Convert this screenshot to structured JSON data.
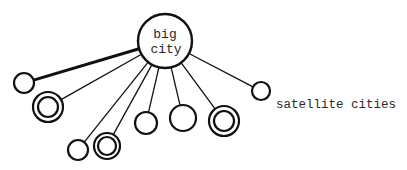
{
  "diagram": {
    "hub": {
      "label_line1": "big",
      "label_line2": "city",
      "cx": 165,
      "cy": 41,
      "r": 27
    },
    "satellites": [
      {
        "id": "sat-1",
        "cx": 24,
        "cy": 83,
        "r": 10,
        "double": false,
        "thick_link": true
      },
      {
        "id": "sat-2",
        "cx": 48,
        "cy": 107,
        "r": 15,
        "inner_r": 10,
        "double": true,
        "thick_link": false
      },
      {
        "id": "sat-3",
        "cx": 78,
        "cy": 150,
        "r": 10,
        "double": false,
        "thick_link": false
      },
      {
        "id": "sat-4",
        "cx": 107,
        "cy": 146,
        "r": 13,
        "inner_r": 9,
        "double": true,
        "thick_link": false
      },
      {
        "id": "sat-5",
        "cx": 146,
        "cy": 123,
        "r": 11,
        "double": false,
        "thick_link": false
      },
      {
        "id": "sat-6",
        "cx": 183,
        "cy": 118,
        "r": 13,
        "double": false,
        "thick_link": false
      },
      {
        "id": "sat-7",
        "cx": 224,
        "cy": 121,
        "r": 15,
        "inner_r": 10,
        "double": true,
        "thick_link": false
      },
      {
        "id": "sat-8",
        "cx": 261,
        "cy": 91,
        "r": 9,
        "double": false,
        "thick_link": false
      }
    ],
    "caption": "satellite cities",
    "stroke_color": "#111111"
  }
}
